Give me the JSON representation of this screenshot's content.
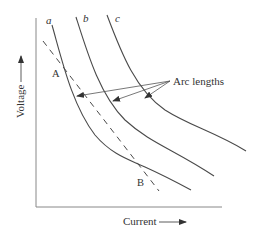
{
  "diagram": {
    "xlabel": "Current",
    "ylabel": "Voltage",
    "curves": [
      {
        "label": "a"
      },
      {
        "label": "b"
      },
      {
        "label": "c"
      }
    ],
    "points": [
      {
        "label": "A"
      },
      {
        "label": "B"
      }
    ],
    "annotation": "Arc lengths",
    "colors": {
      "line": "#4a4a4a",
      "axis": "#777777",
      "text": "#333333"
    }
  }
}
